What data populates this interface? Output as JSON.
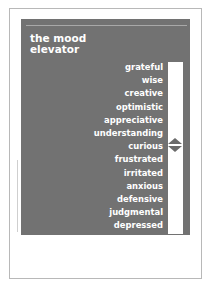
{
  "document": {
    "title_line1": "the mood",
    "title_line2": "elevator",
    "moods": [
      "grateful",
      "wise",
      "creative",
      "optimistic",
      "appreciative",
      "understanding",
      "curious",
      "frustrated",
      "irritated",
      "anxious",
      "defensive",
      "judgmental",
      "depressed"
    ],
    "indicator_position": "curious",
    "colors": {
      "panel": "#727272",
      "text": "#ffffff",
      "bar": "#ffffff",
      "indicator": "#6a6a6a"
    }
  }
}
